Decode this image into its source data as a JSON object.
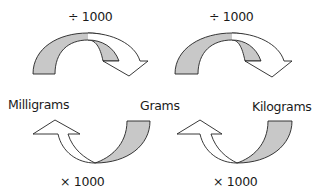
{
  "units": {
    "left": "Milligrams",
    "middle": "Grams",
    "right": "Kilograms"
  },
  "operations": {
    "top_left": "÷ 1000",
    "top_right": "÷ 1000",
    "bottom_left": "× 1000",
    "bottom_right": "× 1000"
  },
  "colors": {
    "fill_gray": "#c8c8c8",
    "stroke": "#222222",
    "arrow_white": "#ffffff"
  }
}
